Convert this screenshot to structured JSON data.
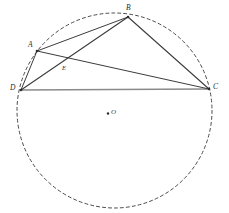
{
  "figure": {
    "canvas": {
      "width": 229,
      "height": 213,
      "background": "#ffffff"
    },
    "colors": {
      "chord_stroke": "#3c3c3c",
      "base_stroke": "#8a8a8a",
      "circle_stroke": "#4a4a4a",
      "label_color": "#2b2b2b",
      "center_dot": "#2b2b2b"
    },
    "circle": {
      "name": "circumscribed-circle",
      "center_x": 114.5,
      "center_y": 110.5,
      "radius": 97.5,
      "style": "dashed",
      "dash_pattern": "3 3",
      "stroke_width": 1
    },
    "center": {
      "name": "center-O",
      "label": "O",
      "dot_x": 108,
      "dot_y": 113.5,
      "label_x": 111,
      "label_y": 110
    },
    "points": [
      {
        "id": "A",
        "label": "A",
        "x": 37,
        "y": 51,
        "label_x": 28,
        "label_y": 41
      },
      {
        "id": "B",
        "label": "B",
        "x": 128,
        "y": 17,
        "label_x": 126,
        "label_y": 5
      },
      {
        "id": "C",
        "label": "C",
        "x": 209,
        "y": 89,
        "label_x": 213,
        "label_y": 83
      },
      {
        "id": "D",
        "label": "D",
        "x": 21,
        "y": 90,
        "label_x": 10,
        "label_y": 84
      },
      {
        "id": "E",
        "label": "E",
        "x": 64,
        "y": 63,
        "label_x": 62,
        "label_y": 65
      }
    ],
    "segments": [
      {
        "name": "segment-DA",
        "from": "D",
        "to": "A",
        "x1": 21,
        "y1": 90,
        "x2": 37,
        "y2": 51,
        "kind": "chord"
      },
      {
        "name": "segment-AB",
        "from": "A",
        "to": "B",
        "x1": 37,
        "y1": 51,
        "x2": 128,
        "y2": 17,
        "kind": "chord"
      },
      {
        "name": "segment-BC",
        "from": "B",
        "to": "C",
        "x1": 128,
        "y1": 17,
        "x2": 209,
        "y2": 89,
        "kind": "chord"
      },
      {
        "name": "segment-DC",
        "from": "D",
        "to": "C",
        "x1": 21,
        "y1": 90,
        "x2": 209,
        "y2": 89,
        "kind": "base"
      },
      {
        "name": "diagonal-DB",
        "from": "D",
        "to": "B",
        "x1": 21,
        "y1": 90,
        "x2": 128,
        "y2": 17,
        "kind": "diagonal"
      },
      {
        "name": "diagonal-AC",
        "from": "A",
        "to": "C",
        "x1": 37,
        "y1": 51,
        "x2": 209,
        "y2": 89,
        "kind": "diagonal"
      }
    ]
  }
}
